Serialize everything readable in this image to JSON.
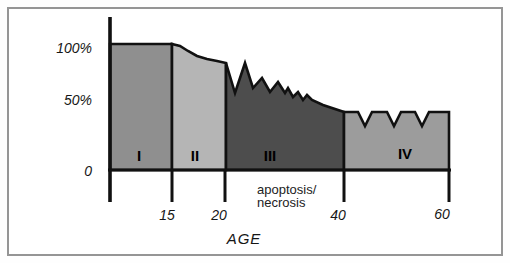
{
  "figure_title": "cell-survival-vs-age-figure",
  "chart_data": {
    "type": "area",
    "title": "",
    "xlabel": "AGE",
    "ylabel": "",
    "legend": "none",
    "grid": false,
    "ylim_pct": [
      0,
      100
    ],
    "outline_color": "#111111",
    "frame_color": "#959595",
    "yticks": [
      {
        "label": "100%",
        "value": 100
      },
      {
        "label": "50%",
        "value": 50
      },
      {
        "label": "0",
        "value": 0
      }
    ],
    "xticks": [
      {
        "label": "15",
        "value": 15
      },
      {
        "label": "20",
        "value": 20
      },
      {
        "label": "40",
        "value": 40
      },
      {
        "label": "60",
        "value": 60
      }
    ],
    "annotation": {
      "line1": "apoptosis/",
      "line2": "necrosis"
    },
    "phases": [
      {
        "label": "I",
        "age_range": [
          0,
          15
        ],
        "level_pct_start": 100,
        "level_pct_end": 100,
        "fill": "#8f8f8f",
        "description": "flat plateau at 100%"
      },
      {
        "label": "II",
        "age_range": [
          15,
          20
        ],
        "level_pct_start": 100,
        "level_pct_end": 85,
        "fill": "#b5b5b5",
        "description": "smooth concave decline 100% to ~85%"
      },
      {
        "label": "III",
        "age_range": [
          20,
          40
        ],
        "level_pct_start": 85,
        "level_pct_end": 46,
        "fill": "#4d4d4d",
        "description": "jagged spiky decline ~85% to ~46%, apoptosis/necrosis"
      },
      {
        "label": "IV",
        "age_range": [
          40,
          60
        ],
        "level_pct_start": 46,
        "level_pct_end": 46,
        "fill": "#9c9c9c",
        "description": "plateau ~46% with three V-notches dipping to ~36%"
      }
    ],
    "geometry": {
      "axis": {
        "x0": 110,
        "y_top": 17,
        "y_base": 170,
        "tick_bottom": 202,
        "x_end": 451
      },
      "tick_x": [
        172,
        225,
        344,
        449
      ],
      "stroke_region": 2.6,
      "stroke_axis": 3.6,
      "stroke_base": 3,
      "region_tops": [
        [
          [
            110,
            44
          ],
          [
            172,
            44
          ]
        ],
        [
          [
            172,
            44
          ],
          [
            180,
            46
          ],
          [
            188,
            51
          ],
          [
            197,
            56
          ],
          [
            207,
            59
          ],
          [
            217,
            61
          ],
          [
            226,
            63
          ]
        ],
        [
          [
            226,
            63
          ],
          [
            235,
            93
          ],
          [
            245,
            63
          ],
          [
            253,
            88
          ],
          [
            262,
            78
          ],
          [
            270,
            92
          ],
          [
            278,
            82
          ],
          [
            285,
            93
          ],
          [
            288,
            88
          ],
          [
            293,
            97
          ],
          [
            298,
            92
          ],
          [
            303,
            100
          ],
          [
            307,
            95
          ],
          [
            312,
            100
          ],
          [
            323,
            105
          ],
          [
            344,
            112
          ]
        ],
        [
          [
            344,
            112
          ],
          [
            358,
            112
          ],
          [
            365,
            126
          ],
          [
            372,
            112
          ],
          [
            387,
            112
          ],
          [
            394,
            126
          ],
          [
            401,
            112
          ],
          [
            415,
            112
          ],
          [
            422,
            126
          ],
          [
            429,
            112
          ],
          [
            449,
            112
          ]
        ]
      ]
    }
  }
}
